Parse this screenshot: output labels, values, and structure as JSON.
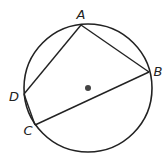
{
  "diagram": {
    "type": "inscribed-quadrilateral",
    "circle": {
      "cx": 88,
      "cy": 88,
      "r": 64,
      "stroke": "#222222"
    },
    "center_dot": {
      "cx": 88,
      "cy": 88,
      "r": 3,
      "fill": "#444444"
    },
    "points": {
      "A": {
        "label": "A",
        "x": 81,
        "y": 25,
        "lx": 81,
        "ly": 19
      },
      "B": {
        "label": "B",
        "x": 149,
        "y": 72,
        "lx": 158,
        "ly": 76
      },
      "C": {
        "label": "C",
        "x": 35,
        "y": 125,
        "lx": 28,
        "ly": 135
      },
      "D": {
        "label": "D",
        "x": 24,
        "y": 94,
        "lx": 14,
        "ly": 101
      }
    },
    "segments": [
      [
        "A",
        "B"
      ],
      [
        "B",
        "C"
      ],
      [
        "C",
        "D"
      ],
      [
        "D",
        "A"
      ]
    ],
    "line_color": "#222222"
  }
}
